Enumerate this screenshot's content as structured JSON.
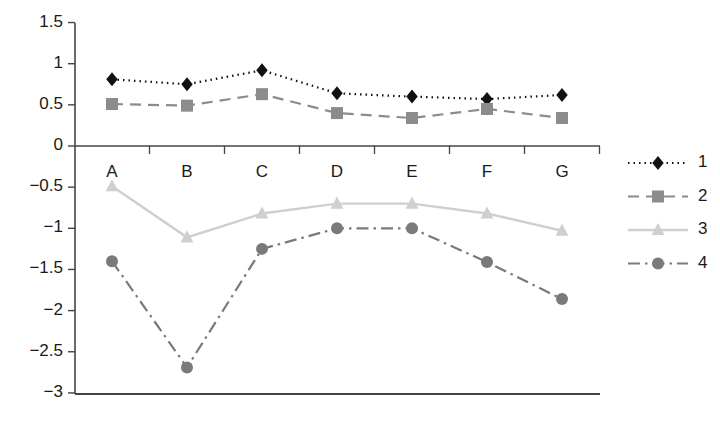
{
  "chart_data": {
    "type": "line",
    "title": "",
    "xlabel": "",
    "ylabel": "",
    "categories": [
      "A",
      "B",
      "C",
      "D",
      "E",
      "F",
      "G"
    ],
    "ylim": [
      -3,
      1.5
    ],
    "yticks": [
      1.5,
      1,
      0.5,
      0,
      -0.5,
      -1,
      -1.5,
      -2,
      -2.5,
      -3
    ],
    "ytick_labels": [
      "1.5",
      "1",
      "0.5",
      "0",
      "-0.5",
      "-1",
      "-1.5",
      "-2",
      "-2.5",
      "-3"
    ],
    "grid": false,
    "legend_position": "right",
    "series": [
      {
        "name": "1",
        "values": [
          0.81,
          0.75,
          0.92,
          0.64,
          0.6,
          0.57,
          0.62
        ],
        "color": "#111111",
        "marker": "diamond",
        "line_style": "dotted"
      },
      {
        "name": "2",
        "values": [
          0.51,
          0.49,
          0.63,
          0.4,
          0.34,
          0.45,
          0.34
        ],
        "color": "#8c8c8c",
        "marker": "square",
        "line_style": "dashed"
      },
      {
        "name": "3",
        "values": [
          -0.49,
          -1.11,
          -0.82,
          -0.7,
          -0.7,
          -0.82,
          -1.03
        ],
        "color": "#cfcfcf",
        "marker": "triangle",
        "line_style": "solid"
      },
      {
        "name": "4",
        "values": [
          -1.4,
          -2.69,
          -1.25,
          -1.0,
          -1.0,
          -1.41,
          -1.86
        ],
        "color": "#7a7a7a",
        "marker": "circle",
        "line_style": "dash-dot"
      }
    ]
  },
  "axis": {
    "zero_line_label": "0",
    "baseline_label": "-3"
  },
  "legend": {
    "items": [
      {
        "label": "1"
      },
      {
        "label": "2"
      },
      {
        "label": "3"
      },
      {
        "label": "4"
      }
    ]
  }
}
